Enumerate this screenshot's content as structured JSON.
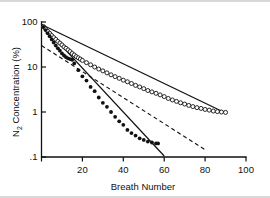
{
  "figure": {
    "background": "#ffffff",
    "ink_color": "#111111",
    "border_color": "#d8d8d8"
  },
  "chart_data": {
    "type": "scatter",
    "title": "",
    "subtitle": "",
    "xlabel": "Breath Number",
    "ylabel": "N2 Concentration (%)",
    "ylabel_display": "N₂ Concentration (%)",
    "xscale": "linear",
    "yscale": "log",
    "xlim": [
      0,
      100
    ],
    "ylim": [
      0.1,
      100
    ],
    "grid": false,
    "legend": "none",
    "xticks": [
      0,
      20,
      40,
      60,
      80,
      100
    ],
    "xticklabels": [
      "",
      "20",
      "40",
      "60",
      "80",
      "100"
    ],
    "yticks": [
      100,
      10,
      1,
      0.1
    ],
    "yticklabels": [
      "100",
      "10",
      "1",
      ".1"
    ],
    "series": [
      {
        "name": "open-circles",
        "marker": "open circle",
        "values_x": [
          1,
          2,
          3,
          4,
          5,
          6,
          7,
          8,
          9,
          10,
          11,
          12,
          13,
          14,
          15,
          16,
          17,
          18,
          19,
          20,
          22,
          24,
          26,
          28,
          30,
          32,
          34,
          36,
          38,
          40,
          42,
          44,
          46,
          48,
          50,
          52,
          54,
          56,
          58,
          60,
          62,
          64,
          66,
          68,
          70,
          72,
          74,
          76,
          78,
          80,
          82,
          84,
          86,
          88,
          90
        ],
        "values_y": [
          79,
          70,
          62,
          56,
          50,
          45,
          41,
          37,
          34,
          31,
          28,
          26,
          24,
          22,
          20,
          18.5,
          17,
          16,
          15,
          14,
          12.5,
          11.2,
          10.0,
          9.0,
          8.2,
          7.4,
          6.7,
          6.1,
          5.6,
          5.1,
          4.7,
          4.3,
          3.9,
          3.6,
          3.3,
          3.0,
          2.8,
          2.6,
          2.4,
          2.2,
          2.0,
          1.85,
          1.72,
          1.6,
          1.5,
          1.4,
          1.32,
          1.25,
          1.2,
          1.14,
          1.1,
          1.05,
          1.02,
          1.0,
          0.98
        ]
      },
      {
        "name": "filled-circles",
        "marker": "filled circle",
        "values_x": [
          1,
          2,
          3,
          4,
          5,
          6,
          7,
          8,
          9,
          10,
          11,
          12,
          13,
          14,
          15,
          16,
          18,
          20,
          22,
          24,
          26,
          28,
          30,
          32,
          34,
          36,
          38,
          40,
          42,
          44,
          46,
          48,
          50,
          52,
          54,
          56,
          57
        ],
        "values_y": [
          78,
          66,
          56,
          48,
          41,
          35,
          30,
          26,
          23,
          20,
          18,
          16.5,
          15.5,
          15.0,
          14.5,
          12.0,
          8.5,
          6.2,
          5.0,
          3.6,
          2.9,
          2.1,
          1.6,
          1.3,
          1.0,
          0.78,
          0.62,
          0.52,
          0.4,
          0.34,
          0.3,
          0.26,
          0.24,
          0.22,
          0.21,
          0.2,
          0.2
        ]
      }
    ],
    "fit_lines": [
      {
        "name": "open-circle-fit",
        "style": "solid",
        "x": [
          0,
          90
        ],
        "y": [
          88,
          0.95
        ]
      },
      {
        "name": "filled-circle-fit",
        "style": "solid",
        "x": [
          0,
          60
        ],
        "y": [
          90,
          0.105
        ]
      },
      {
        "name": "slow-compartment-extrapolation",
        "style": "dashed",
        "x": [
          0,
          80
        ],
        "y": [
          30,
          0.145
        ]
      }
    ],
    "annotations": []
  }
}
